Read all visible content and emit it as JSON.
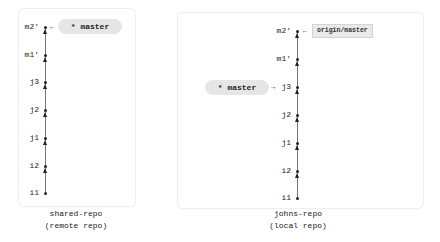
{
  "diagram": {
    "colors": {
      "pill_bg": "#e6e6e6",
      "tag_bg": "#e9e9e9",
      "line": "#777777",
      "text": "#222222",
      "panel_border": "#eeeeee"
    },
    "left": {
      "caption_line1": "shared-repo",
      "caption_line2": "(remote repo)",
      "commits": [
        "m2'",
        "m1'",
        "j3",
        "j2",
        "j1",
        "i2",
        "i1"
      ],
      "branch_pill": "* master",
      "branch_points_to": "m2'",
      "pointer_glyph": "←"
    },
    "right": {
      "caption_line1": "johns-repo",
      "caption_line2": "(local repo)",
      "commits": [
        "m2'",
        "m1'",
        "j3",
        "j2",
        "j1",
        "i2",
        "i1"
      ],
      "remote_tag": "origin/master",
      "remote_tag_points_to": "m2'",
      "remote_pointer_glyph": "←",
      "branch_pill": "* master",
      "branch_points_to": "j3",
      "branch_pointer_glyph": "→"
    }
  }
}
